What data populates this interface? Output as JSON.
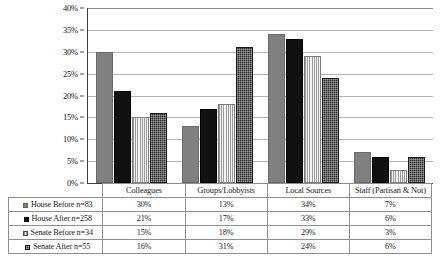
{
  "chart_data": {
    "type": "bar",
    "title": "",
    "subtitle": "",
    "xlabel": "",
    "ylabel": "",
    "ylim": [
      0,
      40
    ],
    "ytick_labels": [
      "0%",
      "5%",
      "10%",
      "15%",
      "20%",
      "25%",
      "30%",
      "35%",
      "40%"
    ],
    "ytick_values": [
      0,
      5,
      10,
      15,
      20,
      25,
      30,
      35,
      40
    ],
    "grid": true,
    "legend_position": "bottom-table",
    "categories": [
      "Colleagues",
      "Groups/Lobbyists",
      "Local Sources",
      "Staff (Partisan & Not)"
    ],
    "series": [
      {
        "name": "House Before n=83",
        "values": [
          30,
          13,
          34,
          7
        ],
        "value_labels": [
          "30%",
          "13%",
          "34%",
          "7%"
        ],
        "fill": "solid-gray",
        "color": "#808080"
      },
      {
        "name": "House After n=258",
        "values": [
          21,
          17,
          33,
          6
        ],
        "value_labels": [
          "21%",
          "17%",
          "33%",
          "6%"
        ],
        "fill": "solid-black",
        "color": "#111111"
      },
      {
        "name": "Senate Before n=34",
        "values": [
          15,
          18,
          29,
          3
        ],
        "value_labels": [
          "15%",
          "18%",
          "29%",
          "3%"
        ],
        "fill": "light-vertical-stripe",
        "color": "#ececec"
      },
      {
        "name": "Senate After n=55",
        "values": [
          16,
          31,
          24,
          6
        ],
        "value_labels": [
          "16%",
          "31%",
          "24%",
          "6%"
        ],
        "fill": "dark-checker",
        "color": "#2b2b2b"
      }
    ]
  },
  "table": {
    "column_headers": [
      "Colleagues",
      "Groups/Lobbyists",
      "Local Sources",
      "Staff (Partisan & Not)"
    ],
    "rows": [
      {
        "label": "House Before n=83",
        "cells": [
          "30%",
          "13%",
          "34%",
          "7%"
        ]
      },
      {
        "label": "House After n=258",
        "cells": [
          "21%",
          "17%",
          "33%",
          "6%"
        ]
      },
      {
        "label": "Senate Before n=34",
        "cells": [
          "15%",
          "18%",
          "29%",
          "3%"
        ]
      },
      {
        "label": "Senate After n=55",
        "cells": [
          "16%",
          "31%",
          "24%",
          "6%"
        ]
      }
    ]
  },
  "colors": {
    "series1": "#808080",
    "series2": "#111111",
    "series3": "#ececec",
    "series4": "#2b2b2b",
    "gridline": "#b2b2b2",
    "axis": "#3d3d3d",
    "table_border": "#8e8e8e",
    "background": "#ffffff"
  }
}
